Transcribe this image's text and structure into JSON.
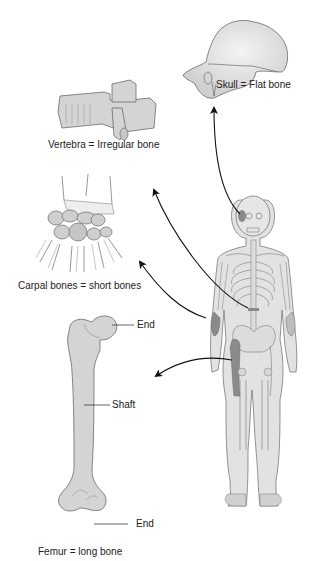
{
  "diagram": {
    "colors": {
      "bone_fill": "#d4d4d4",
      "bone_stroke": "#6a6a6a",
      "highlight_fill": "#8a8a8a",
      "skeleton_fill": "#e2e2e2",
      "arrow": "#111111",
      "text": "#222222"
    },
    "labels": {
      "skull": "Skull = Flat bone",
      "vertebra": "Vertebra = Irregular bone",
      "carpal": "Carpal bones = short bones",
      "femur": "Femur = long bone",
      "femur_end_top": "End",
      "femur_shaft": "Shaft",
      "femur_end_bottom": "End"
    },
    "nodes": [
      {
        "id": "skull",
        "label": "Skull = Flat bone",
        "type": "flat bone"
      },
      {
        "id": "vertebra",
        "label": "Vertebra = Irregular bone",
        "type": "irregular bone"
      },
      {
        "id": "carpal",
        "label": "Carpal bones = short bones",
        "type": "short bone"
      },
      {
        "id": "femur",
        "label": "Femur = long bone",
        "type": "long bone",
        "parts": [
          "End",
          "Shaft",
          "End"
        ]
      },
      {
        "id": "skeleton",
        "label": "Full human skeleton"
      }
    ],
    "edges": [
      {
        "from": "skeleton",
        "to": "skull"
      },
      {
        "from": "skeleton",
        "to": "vertebra"
      },
      {
        "from": "skeleton",
        "to": "carpal"
      },
      {
        "from": "skeleton",
        "to": "femur"
      }
    ]
  }
}
